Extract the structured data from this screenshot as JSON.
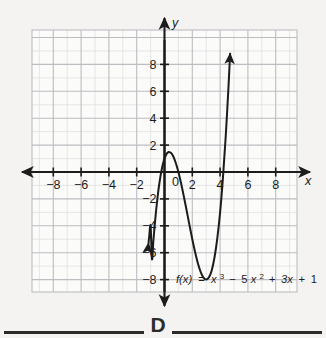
{
  "page": {
    "background_color": "#f4f3f1",
    "figure_label": "D"
  },
  "chart_data": {
    "type": "line",
    "title": "",
    "subtitle": "",
    "function_label": "f(x) = x³ − 5x² + 3x + 1",
    "function_parts": {
      "fx": "f(x)",
      "equals": "=",
      "term1_base": "x",
      "term1_exp": "3",
      "minus": "−",
      "term2_coef": "5",
      "term2_base": "x",
      "term2_exp": "2",
      "plus1": "+",
      "term3": "3x",
      "plus2": "+",
      "term4": "1"
    },
    "xlabel": "x",
    "ylabel": "y",
    "xlim": [
      -9.6,
      9.6
    ],
    "ylim": [
      -9.8,
      9.8
    ],
    "x_ticks": [
      -8,
      -6,
      -4,
      -2,
      2,
      4,
      6,
      8
    ],
    "x_tick_labels": [
      "−8",
      "−6",
      "−4",
      "−2",
      "2",
      "4",
      "6",
      "8"
    ],
    "y_ticks": [
      8,
      6,
      4,
      2,
      -2,
      -4,
      -6,
      -8
    ],
    "y_tick_labels": [
      "8",
      "6",
      "4",
      "2",
      "−2",
      "−4",
      "−6",
      "−8"
    ],
    "origin_label": "0",
    "grid": true,
    "grid_minor_step": 1,
    "grid_major_step": 2,
    "legend": "none",
    "curve_color": "#1c1c1c",
    "grid_color": "#c9c9cb",
    "axis_color": "#1c1c1c",
    "domain_drawn": [
      -1.15,
      4.72
    ],
    "arrow_start": "down",
    "arrow_end": "up",
    "features": {
      "local_max": {
        "x": 0.333,
        "y": 1.513
      },
      "local_min": {
        "x": 3.0,
        "y": -8.0
      },
      "y_intercept": {
        "x": 0,
        "y": 1
      }
    },
    "points": [
      [
        -1.15,
        -5.3
      ],
      [
        -1.1,
        -4.8
      ],
      [
        -1.0,
        -4.0
      ],
      [
        -0.9,
        -6.48
      ],
      [
        -0.8,
        -5.11
      ],
      [
        -0.7,
        -3.89
      ],
      [
        -0.6,
        -2.82
      ],
      [
        -0.5,
        -1.88
      ],
      [
        -0.4,
        -1.06
      ],
      [
        -0.3,
        -0.38
      ],
      [
        -0.2,
        0.19
      ],
      [
        -0.1,
        0.65
      ],
      [
        0.0,
        1.0
      ],
      [
        0.1,
        1.25
      ],
      [
        0.2,
        1.41
      ],
      [
        0.3,
        1.48
      ],
      [
        0.4,
        1.46
      ],
      [
        0.5,
        1.38
      ],
      [
        0.6,
        1.22
      ],
      [
        0.7,
        1.0
      ],
      [
        0.8,
        0.71
      ],
      [
        0.9,
        0.38
      ],
      [
        1.0,
        0.0
      ],
      [
        1.2,
        -0.87
      ],
      [
        1.4,
        -1.86
      ],
      [
        1.6,
        -2.9
      ],
      [
        1.8,
        -3.97
      ],
      [
        2.0,
        -5.0
      ],
      [
        2.2,
        -5.95
      ],
      [
        2.4,
        -6.78
      ],
      [
        2.6,
        -7.42
      ],
      [
        2.8,
        -7.85
      ],
      [
        3.0,
        -8.0
      ],
      [
        3.2,
        -7.83
      ],
      [
        3.4,
        -7.3
      ],
      [
        3.6,
        -6.34
      ],
      [
        3.8,
        -4.91
      ],
      [
        4.0,
        -3.0
      ],
      [
        4.2,
        -0.49
      ],
      [
        4.4,
        2.58
      ],
      [
        4.6,
        6.26
      ],
      [
        4.72,
        8.8
      ]
    ]
  }
}
